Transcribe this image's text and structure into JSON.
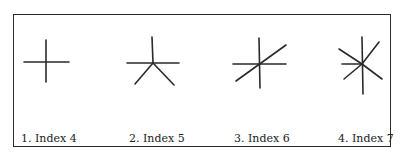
{
  "figures": [
    {
      "label": "1. Index 4",
      "index": 4
    },
    {
      "label": "2. Index 5",
      "index": 5
    },
    {
      "label": "3. Index 6",
      "index": 6
    },
    {
      "label": "4. Index 7",
      "index": 7
    }
  ],
  "colors": {
    "stroke": "#2a2a2a",
    "border": "#2a2a2a",
    "background": "#ffffff"
  }
}
